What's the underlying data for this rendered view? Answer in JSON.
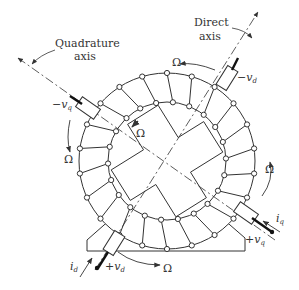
{
  "diagram": {
    "type": "schematic",
    "labels": {
      "direct_axis_line1": "Direct",
      "direct_axis_line2": "axis",
      "quadrature_axis_line1": "Quadrature",
      "quadrature_axis_line2": "axis",
      "omega": "Ω",
      "minus_vd": "−v",
      "minus_vd_sub": "d",
      "plus_vd": "+v",
      "plus_vd_sub": "d",
      "minus_vq": "−v",
      "minus_vq_sub": "q",
      "plus_vq": "+v",
      "plus_vq_sub": "q",
      "id": "i",
      "id_sub": "d",
      "iq": "i",
      "iq_sub": "q"
    },
    "nodes": [
      {
        "id": "stator",
        "label": "stator ring with windings"
      },
      {
        "id": "rotor",
        "label": "salient rotor"
      },
      {
        "id": "brush_d_top",
        "label": "−v_d brush"
      },
      {
        "id": "brush_d_bottom",
        "label": "+v_d brush"
      },
      {
        "id": "brush_q_left",
        "label": "−v_q brush"
      },
      {
        "id": "brush_q_right",
        "label": "+v_q brush"
      },
      {
        "id": "base",
        "label": "machine base"
      }
    ],
    "edges": [
      {
        "from": "brush_d_bottom",
        "to": "brush_d_top",
        "label": "Direct axis"
      },
      {
        "from": "brush_q_right",
        "to": "brush_q_left",
        "label": "Quadrature axis"
      }
    ],
    "colors": {
      "line": "#333333",
      "background": "#ffffff"
    }
  }
}
